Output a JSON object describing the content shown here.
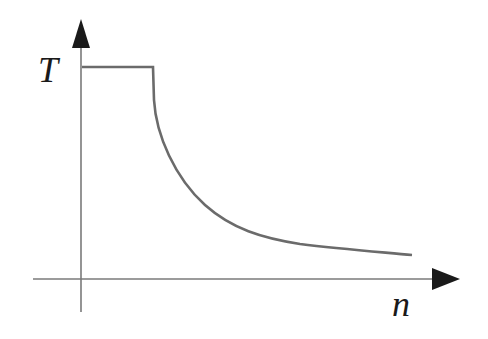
{
  "diagram": {
    "type": "function-curve",
    "y_axis": {
      "label": "T"
    },
    "x_axis": {
      "label": "n"
    },
    "curve": {
      "segments": [
        {
          "kind": "plateau",
          "from": "y-axis",
          "to": "threshold"
        },
        {
          "kind": "drop",
          "note": "short vertical step at threshold"
        },
        {
          "kind": "decay",
          "note": "decreasing convex curve approaching x-axis asymptotically"
        }
      ]
    },
    "colors": {
      "curve": "#6b6b6b",
      "axes": "#7a7a7a",
      "arrows": "#1a1a1a",
      "text": "#1a1a1a",
      "background": "#ffffff"
    }
  }
}
